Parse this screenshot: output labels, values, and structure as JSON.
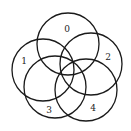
{
  "diagram": {
    "type": "venn",
    "sets": [
      {
        "label": "0",
        "cx": 68,
        "cy": 44,
        "r": 31,
        "label_x": 67,
        "label_y": 29
      },
      {
        "label": "1",
        "cx": 43,
        "cy": 70,
        "r": 31,
        "label_x": 24,
        "label_y": 61
      },
      {
        "label": "2",
        "cx": 91,
        "cy": 64,
        "r": 31,
        "label_x": 108,
        "label_y": 57
      },
      {
        "label": "3",
        "cx": 55,
        "cy": 87,
        "r": 31,
        "label_x": 49,
        "label_y": 110
      },
      {
        "label": "4",
        "cx": 86,
        "cy": 90,
        "r": 31,
        "label_x": 93,
        "label_y": 108
      }
    ],
    "stroke_color": "#1a1a1a",
    "background": "#ffffff"
  }
}
